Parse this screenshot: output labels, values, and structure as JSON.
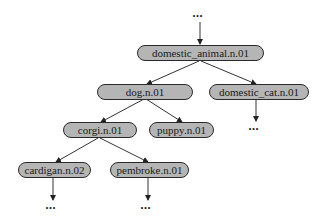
{
  "diagram": {
    "type": "hierarchy-tree",
    "continuation_marker": "···",
    "colors": {
      "node_fill": "#b5b5b5",
      "node_border": "#2a2a2a",
      "edge": "#333333"
    },
    "nodes": {
      "domestic_animal": "domestic_animal.n.01",
      "dog": "dog.n.01",
      "domestic_cat": "domestic_cat.n.01",
      "corgi": "corgi.n.01",
      "puppy": "puppy.n.01",
      "cardigan": "cardigan.n.02",
      "pembroke": "pembroke.n.01"
    },
    "edges": [
      [
        "...",
        "domestic_animal.n.01"
      ],
      [
        "domestic_animal.n.01",
        "dog.n.01"
      ],
      [
        "domestic_animal.n.01",
        "domestic_cat.n.01"
      ],
      [
        "domestic_cat.n.01",
        "..."
      ],
      [
        "dog.n.01",
        "corgi.n.01"
      ],
      [
        "dog.n.01",
        "puppy.n.01"
      ],
      [
        "corgi.n.01",
        "cardigan.n.02"
      ],
      [
        "corgi.n.01",
        "pembroke.n.01"
      ],
      [
        "cardigan.n.02",
        "..."
      ],
      [
        "pembroke.n.01",
        "..."
      ]
    ]
  }
}
